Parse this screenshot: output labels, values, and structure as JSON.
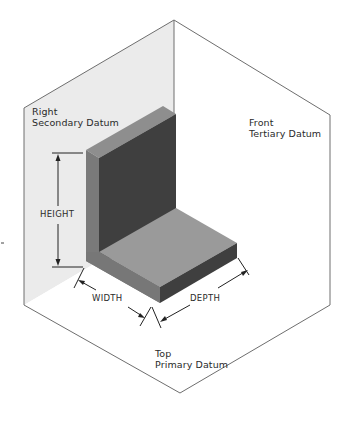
{
  "datums": {
    "right": {
      "line1": "Right",
      "line2": "Secondary Datum"
    },
    "front": {
      "line1": "Front",
      "line2": "Tertiary Datum"
    },
    "top": {
      "line1": "Top",
      "line2": "Primary Datum"
    }
  },
  "dimensions": {
    "height": "HEIGHT",
    "width": "WIDTH",
    "depth": "DEPTH"
  },
  "colors": {
    "right_plane_fill": "#ebebeb",
    "front_plane_fill": "#ffffff",
    "top_plane_fill": "#ffffff",
    "plane_edge": "#6e6e6e",
    "part_dark_face": "#3d3d3d",
    "part_mid_face": "#8a8a8a",
    "part_light_face": "#9a9a9a",
    "part_side_face": "#747474",
    "dimension_line": "#222222"
  }
}
